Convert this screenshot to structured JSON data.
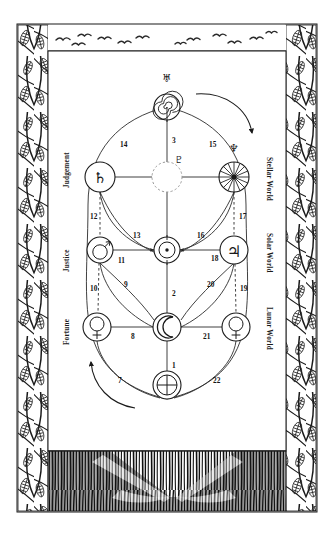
{
  "diagram": {
    "ink_color": "#1a1a1a",
    "paper_color": "#ffffff",
    "border_style": "wheat-stalk lattice with birds above and reed field below"
  },
  "side_labels": {
    "left": [
      {
        "name": "judgement",
        "text": "Judgement"
      },
      {
        "name": "justice",
        "text": "Justice"
      },
      {
        "name": "fortune",
        "text": "Fortune"
      }
    ],
    "right": [
      {
        "name": "stellar-world",
        "text": "Stellar World"
      },
      {
        "name": "solar-world",
        "text": "Solar World"
      },
      {
        "name": "lunar-world",
        "text": "Lunar World"
      }
    ]
  },
  "sephiroth": [
    {
      "id": "kether",
      "glyph": "uranus-spiral",
      "symbol": "♅",
      "label": "Uranus",
      "x": 167,
      "y": 94,
      "r": 13
    },
    {
      "id": "daath",
      "glyph": "pluto-dashed",
      "symbol": "♇",
      "label": "Pluto",
      "x": 167,
      "y": 177,
      "r": 15
    },
    {
      "id": "binah",
      "glyph": "saturn",
      "symbol": "♄",
      "label": "Saturn",
      "x": 100,
      "y": 177,
      "r": 15
    },
    {
      "id": "chokmah",
      "glyph": "neptune-star",
      "symbol": "♆",
      "label": "Neptune",
      "x": 234,
      "y": 177,
      "r": 15
    },
    {
      "id": "geburah",
      "glyph": "mars",
      "symbol": "♂",
      "label": "Mars",
      "x": 100,
      "y": 250,
      "r": 13
    },
    {
      "id": "chesed",
      "glyph": "jupiter",
      "symbol": "♃",
      "label": "Jupiter",
      "x": 234,
      "y": 250,
      "r": 14
    },
    {
      "id": "tiphareth",
      "glyph": "sun",
      "symbol": "☉",
      "label": "Sun",
      "x": 167,
      "y": 250,
      "r": 13
    },
    {
      "id": "hod",
      "glyph": "venus",
      "symbol": "♀",
      "label": "Venus",
      "x": 97,
      "y": 327,
      "r": 14
    },
    {
      "id": "netzach",
      "glyph": "mercury",
      "symbol": "☿",
      "label": "Mercury",
      "x": 236,
      "y": 327,
      "r": 14
    },
    {
      "id": "yesod",
      "glyph": "moon",
      "symbol": "☽",
      "label": "Moon",
      "x": 167,
      "y": 327,
      "r": 14
    },
    {
      "id": "malkuth",
      "glyph": "earth",
      "symbol": "⊕",
      "label": "Earth",
      "x": 167,
      "y": 385,
      "r": 14
    }
  ],
  "glyph_labels": {
    "uranus": "♅",
    "pluto": "♇",
    "neptune": "♆",
    "saturn": "♄",
    "mars": "♂",
    "jupiter": "♃",
    "venus": "♀",
    "mercury": "☿",
    "moon": "☽",
    "earth": "⊕"
  },
  "path_numbers": [
    {
      "n": "1",
      "x": 172,
      "y": 362
    },
    {
      "n": "2",
      "x": 172,
      "y": 290
    },
    {
      "n": "3",
      "x": 172,
      "y": 137
    },
    {
      "n": "7",
      "x": 118,
      "y": 377
    },
    {
      "n": "8",
      "x": 131,
      "y": 333
    },
    {
      "n": "9",
      "x": 124,
      "y": 281
    },
    {
      "n": "10",
      "x": 90,
      "y": 285
    },
    {
      "n": "11",
      "x": 118,
      "y": 257
    },
    {
      "n": "12",
      "x": 90,
      "y": 213
    },
    {
      "n": "13",
      "x": 133,
      "y": 232
    },
    {
      "n": "14",
      "x": 120,
      "y": 141
    },
    {
      "n": "15",
      "x": 209,
      "y": 141
    },
    {
      "n": "16",
      "x": 197,
      "y": 232
    },
    {
      "n": "17",
      "x": 239,
      "y": 213
    },
    {
      "n": "18",
      "x": 211,
      "y": 255
    },
    {
      "n": "19",
      "x": 240,
      "y": 285
    },
    {
      "n": "20",
      "x": 207,
      "y": 281
    },
    {
      "n": "21",
      "x": 203,
      "y": 333
    },
    {
      "n": "22",
      "x": 213,
      "y": 377
    }
  ],
  "arrows": [
    {
      "name": "top-right-arrow",
      "direction": "clockwise-descending"
    },
    {
      "name": "bottom-left-arrow",
      "direction": "counterclockwise-ascending"
    }
  ]
}
